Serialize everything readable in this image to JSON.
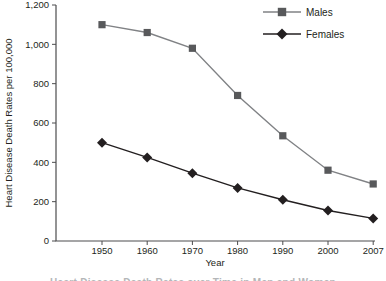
{
  "chart_data": {
    "type": "line",
    "title": "",
    "xlabel": "Year",
    "ylabel": "Heart Disease Death Rates per 100,000",
    "categories": [
      "1950",
      "1960",
      "1970",
      "1980",
      "1990",
      "2000",
      "2007"
    ],
    "series": [
      {
        "name": "Males",
        "marker": "square",
        "color": "#58595b",
        "line_color": "#808285",
        "values": [
          1100,
          1060,
          980,
          740,
          535,
          360,
          290
        ]
      },
      {
        "name": "Females",
        "marker": "diamond",
        "color": "#231f20",
        "line_color": "#231f20",
        "values": [
          500,
          425,
          345,
          270,
          210,
          155,
          115
        ]
      }
    ],
    "ylim": [
      0,
      1200
    ],
    "y_tick_step": 200,
    "y_tick_labels": [
      "0",
      "200",
      "400",
      "600",
      "800",
      "1,000",
      "1,200"
    ],
    "grid": false,
    "legend_position": "top-right"
  },
  "caption_fragment": "Heart Disease Death Rates over Time in Men and Women",
  "colors": {
    "axis": "#4c4c4e",
    "text": "#231f20",
    "background": "#ffffff"
  }
}
